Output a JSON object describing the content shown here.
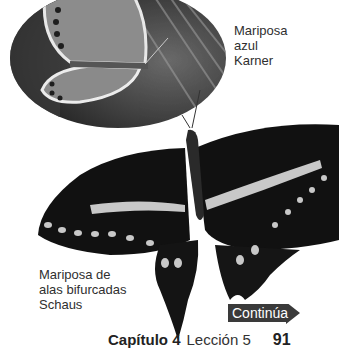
{
  "photos": {
    "karner_blue": {
      "caption_lines": [
        "Mariposa",
        "azul",
        "Karner"
      ]
    },
    "schaus_swallowtail": {
      "caption_lines": [
        "Mariposa de",
        "alas bifurcadas",
        "Schaus"
      ]
    }
  },
  "navigation": {
    "continue_label": "Continúa",
    "continue_color": "#3a3a3a"
  },
  "footer": {
    "chapter": "Capítulo 4",
    "lesson": "Lección 5",
    "page_number": "91"
  }
}
